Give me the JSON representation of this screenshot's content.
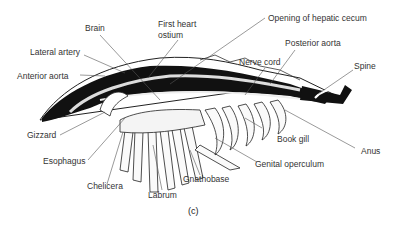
{
  "figure": {
    "caption": "(c)",
    "labels": {
      "brain": "Brain",
      "first_heart_ostium_line1": "First heart",
      "first_heart_ostium_line2": "ostium",
      "opening_hepatic_cecum": "Opening of hepatic cecum",
      "lateral_artery": "Lateral artery",
      "posterior_aorta": "Posterior aorta",
      "anterior_aorta": "Anterior aorta",
      "nerve_cord": "Nerve cord",
      "spine": "Spine",
      "gizzard": "Gizzard",
      "book_gill": "Book gill",
      "anus": "Anus",
      "esophagus": "Esophagus",
      "genital_operculum": "Genital operculum",
      "chelicera": "Chelicera",
      "gnathobase": "Gnathobase",
      "labrum": "Labrum"
    }
  }
}
